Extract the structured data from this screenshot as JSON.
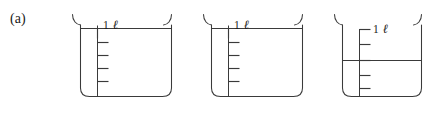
{
  "figure": {
    "panel_label": "(a)",
    "width": 430,
    "height": 117,
    "background_color": "#ffffff",
    "line_color": "#3a3a3a",
    "text_color": "#1a1a1a"
  },
  "beakers": [
    {
      "id": "beaker-1",
      "volume_label": "1",
      "unit_label": "ℓ",
      "fill_level": "full",
      "fill_tick_index": 0,
      "tick_count": 5,
      "label_at_liquid_line": true,
      "x": 72,
      "y": 14,
      "body_width": 100,
      "body_height": 82
    },
    {
      "id": "beaker-2",
      "volume_label": "1",
      "unit_label": "ℓ",
      "fill_level": "full",
      "fill_tick_index": 0,
      "tick_count": 5,
      "label_at_liquid_line": true,
      "x": 203,
      "y": 14,
      "body_width": 100,
      "body_height": 82
    },
    {
      "id": "beaker-3",
      "volume_label": "1",
      "unit_label": "ℓ",
      "fill_level": "half",
      "fill_tick_index": 2,
      "tick_count": 5,
      "label_at_liquid_line": false,
      "x": 334,
      "y": 14,
      "body_width": 100,
      "body_height": 82
    }
  ]
}
